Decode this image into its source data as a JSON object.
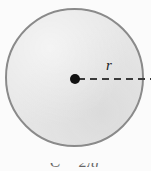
{
  "figure": {
    "name": "circle-with-radius",
    "background_color": "#fbfbfb",
    "width": 151,
    "height": 171
  },
  "circle": {
    "fill_color": "#e7e7e7",
    "stroke_color": "#8a8a8a",
    "center_x": 75,
    "center_y": 79,
    "diameter": 139
  },
  "center_point": {
    "label": "",
    "color": "#111111",
    "diameter": 10
  },
  "radius": {
    "label": "r",
    "line_style": "dashed",
    "line_color": "#3a3a3a"
  },
  "caption": {
    "text": "C = 2πr",
    "clipped": "true"
  }
}
